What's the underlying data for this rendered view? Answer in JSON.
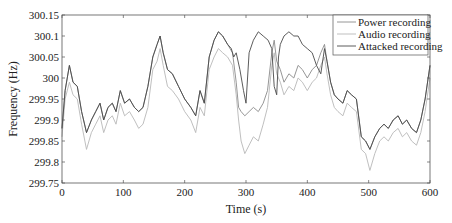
{
  "chart_data": {
    "type": "line",
    "title": "",
    "xlabel": "Time (s)",
    "ylabel": "Frequency (Hz)",
    "xlim": [
      0,
      600
    ],
    "ylim": [
      299.75,
      300.15
    ],
    "xticks": [
      0,
      100,
      200,
      300,
      400,
      500,
      600
    ],
    "xtick_labels": [
      "0",
      "100",
      "200",
      "300",
      "400",
      "500",
      "600"
    ],
    "yticks": [
      299.75,
      299.8,
      299.85,
      299.9,
      299.95,
      300,
      300.05,
      300.1,
      300.15
    ],
    "ytick_labels": [
      "299.75",
      "299.8",
      "299.85",
      "299.9",
      "299.95",
      "300",
      "300.05",
      "300.1",
      "300.15"
    ],
    "grid": false,
    "legend_position": "upper right",
    "series": [
      {
        "name": "Power recording",
        "color": "#8a8a8a",
        "x": [
          0,
          5,
          12,
          18,
          25,
          32,
          40,
          48,
          55,
          62,
          68,
          75,
          82,
          88,
          95,
          102,
          110,
          118,
          125,
          132,
          140,
          148,
          155,
          160,
          165,
          172,
          180,
          190,
          200,
          210,
          218,
          225,
          232,
          240,
          248,
          255,
          262,
          270,
          278,
          284,
          288,
          292,
          298,
          305,
          312,
          320,
          328,
          335,
          342,
          346,
          350,
          356,
          362,
          370,
          378,
          385,
          392,
          400,
          408,
          415,
          422,
          428,
          432,
          438,
          444,
          450,
          458,
          465,
          472,
          480,
          488,
          495,
          502,
          510,
          518,
          525,
          532,
          540,
          548,
          555,
          562,
          570,
          578,
          585,
          592,
          600
        ],
        "y": [
          299.88,
          299.97,
          300.03,
          299.99,
          299.98,
          299.92,
          299.87,
          299.9,
          299.92,
          299.94,
          299.9,
          299.93,
          299.94,
          299.92,
          299.97,
          299.94,
          299.95,
          299.93,
          299.92,
          299.93,
          299.98,
          300.05,
          300.08,
          300.1,
          300.06,
          300.02,
          300.01,
          299.98,
          299.95,
          299.93,
          299.91,
          299.97,
          299.94,
          300.05,
          300.09,
          300.11,
          300.1,
          300.08,
          300.06,
          299.99,
          299.93,
          299.92,
          299.91,
          299.92,
          299.93,
          299.92,
          299.94,
          299.97,
          300.06,
          300.09,
          300.04,
          300.02,
          299.99,
          300.01,
          300.0,
          300.03,
          300.02,
          300.0,
          300.02,
          300.03,
          300.06,
          300.08,
          300.04,
          299.99,
          299.96,
          299.95,
          299.94,
          299.97,
          299.96,
          299.95,
          299.86,
          299.85,
          299.83,
          299.86,
          299.88,
          299.89,
          299.88,
          299.9,
          299.91,
          299.89,
          299.9,
          299.88,
          299.87,
          299.9,
          299.95,
          300.03
        ]
      },
      {
        "name": "Audio recording",
        "color": "#b8b8b8",
        "x": [
          0,
          5,
          12,
          18,
          25,
          32,
          40,
          48,
          55,
          62,
          68,
          75,
          82,
          88,
          95,
          102,
          110,
          118,
          125,
          132,
          140,
          148,
          155,
          160,
          165,
          172,
          180,
          190,
          200,
          210,
          218,
          225,
          232,
          240,
          248,
          255,
          262,
          270,
          278,
          284,
          288,
          292,
          298,
          305,
          312,
          320,
          328,
          335,
          342,
          346,
          350,
          356,
          362,
          370,
          378,
          385,
          392,
          400,
          408,
          415,
          422,
          428,
          432,
          438,
          444,
          450,
          458,
          465,
          472,
          480,
          488,
          495,
          502,
          510,
          518,
          525,
          532,
          540,
          548,
          555,
          562,
          570,
          578,
          585,
          592,
          600
        ],
        "y": [
          299.86,
          299.95,
          299.99,
          299.96,
          299.95,
          299.89,
          299.83,
          299.87,
          299.89,
          299.91,
          299.87,
          299.9,
          299.91,
          299.89,
          299.94,
          299.91,
          299.92,
          299.9,
          299.88,
          299.89,
          299.93,
          300.02,
          300.04,
          300.07,
          300.03,
          299.98,
          299.97,
          299.95,
          299.92,
          299.9,
          299.87,
          299.93,
          299.91,
          300.02,
          300.05,
          300.07,
          300.06,
          300.05,
          300.03,
          299.96,
          299.9,
          299.85,
          299.82,
          299.84,
          299.86,
          299.85,
          299.89,
          299.93,
          300.03,
          300.06,
          300.01,
          299.99,
          299.96,
          299.98,
          299.97,
          300.0,
          299.99,
          299.97,
          299.99,
          300.0,
          300.03,
          300.05,
          300.01,
          299.96,
          299.93,
          299.92,
          299.91,
          299.94,
          299.93,
          299.92,
          299.83,
          299.82,
          299.78,
          299.82,
          299.85,
          299.86,
          299.85,
          299.87,
          299.88,
          299.86,
          299.87,
          299.85,
          299.84,
          299.87,
          299.92,
          300.0
        ]
      },
      {
        "name": "Attacked recording",
        "color": "#4a4a4a",
        "x": [
          0,
          5,
          12,
          18,
          25,
          32,
          40,
          48,
          55,
          62,
          68,
          75,
          82,
          88,
          95,
          102,
          110,
          118,
          125,
          132,
          140,
          148,
          155,
          160,
          165,
          172,
          180,
          190,
          200,
          210,
          218,
          225,
          232,
          240,
          248,
          255,
          262,
          270,
          276,
          280,
          284,
          290,
          296,
          300,
          305,
          312,
          320,
          328,
          336,
          342,
          346,
          350,
          353,
          356,
          362,
          370,
          378,
          385,
          392,
          400,
          408,
          415,
          422,
          428,
          432,
          438,
          444,
          450,
          458,
          465,
          472,
          480,
          488,
          495,
          502,
          510,
          518,
          525,
          532,
          540,
          548,
          555,
          562,
          570,
          578,
          585,
          592,
          600
        ],
        "y": [
          299.88,
          299.97,
          300.03,
          299.99,
          299.98,
          299.92,
          299.87,
          299.9,
          299.92,
          299.94,
          299.9,
          299.93,
          299.94,
          299.92,
          299.97,
          299.94,
          299.95,
          299.93,
          299.92,
          299.93,
          299.98,
          300.05,
          300.08,
          300.1,
          300.06,
          300.02,
          300.01,
          299.98,
          299.95,
          299.93,
          299.91,
          299.97,
          299.94,
          300.05,
          300.09,
          300.11,
          300.1,
          300.08,
          300.07,
          300.05,
          300.06,
          300.02,
          299.97,
          299.94,
          300.06,
          300.09,
          300.11,
          300.1,
          300.09,
          300.07,
          299.98,
          299.96,
          300.05,
          300.08,
          300.1,
          300.11,
          300.1,
          300.1,
          300.08,
          300.07,
          300.06,
          300.03,
          300.01,
          300.07,
          300.04,
          299.99,
          299.96,
          299.95,
          299.94,
          299.97,
          299.96,
          299.95,
          299.86,
          299.85,
          299.83,
          299.86,
          299.88,
          299.89,
          299.88,
          299.9,
          299.91,
          299.89,
          299.9,
          299.88,
          299.87,
          299.9,
          299.95,
          300.03
        ]
      }
    ]
  }
}
